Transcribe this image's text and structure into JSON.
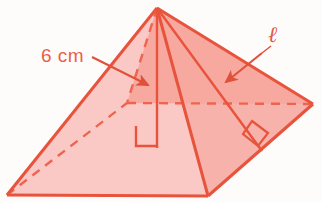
{
  "figure": {
    "name": "square-pyramid-diagram",
    "shape": "square pyramid",
    "background_color": "#fdfcfb",
    "colors": {
      "outline": "#e8533c",
      "face_left": "#fac9c6",
      "face_front": "#f7b2ab",
      "face_right": "#f79d92",
      "face_back": "#fbd3d0",
      "label": "#e8604a",
      "dashed": "#ef6450",
      "arrow": "#e0513a"
    },
    "labels": [
      {
        "id": "height-label",
        "name": "height-label",
        "text": "6 cm",
        "meaning": "perpendicular height of the pyramid",
        "x": 41,
        "y": 61,
        "arrow_from": [
          92,
          57
        ],
        "arrow_to": [
          152,
          87
        ]
      },
      {
        "id": "slant-label",
        "name": "slant-height-label",
        "text": "ℓ",
        "meaning": "slant height of a lateral face",
        "x": 272,
        "y": 42,
        "arrow_from": [
          262,
          53
        ],
        "arrow_to": [
          222,
          85
        ]
      }
    ],
    "vertices": {
      "apex": [
        157,
        8
      ],
      "front": [
        208,
        196
      ],
      "left": [
        7,
        195
      ],
      "right": [
        313,
        104
      ],
      "back": [
        127,
        103
      ]
    },
    "right_angle_marks": [
      {
        "id": "height-right-angle",
        "name": "right-angle-mark-height",
        "x": 126,
        "y": 128
      },
      {
        "id": "slant-right-angle",
        "name": "right-angle-mark-slant",
        "x": 258,
        "y": 122
      }
    ],
    "edges": {
      "solid": [
        "apex-left",
        "apex-front",
        "apex-right",
        "left-front",
        "front-right"
      ],
      "dashed": [
        "apex-back",
        "left-back",
        "back-right"
      ],
      "height_segment": "apex-to-base-center",
      "slant_segment": "apex-to-front-right-edge-midpoint"
    }
  }
}
